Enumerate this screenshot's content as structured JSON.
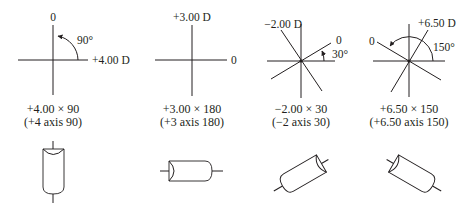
{
  "figure": {
    "panels": [
      {
        "id": "panel-1",
        "axis_labels": {
          "top": "0",
          "right": "+4.00 D"
        },
        "angle_label": "90°",
        "caption_line1": "+4.00 × 90",
        "caption_line2": "(+4 axis 90)"
      },
      {
        "id": "panel-2",
        "axis_labels": {
          "top": "+3.00 D",
          "right": "0"
        },
        "caption_line1": "+3.00 × 180",
        "caption_line2": "(+3 axis 180)"
      },
      {
        "id": "panel-3",
        "axis_labels": {
          "power": "−2.00 D",
          "axis": "0"
        },
        "angle_label": "30°",
        "caption_line1": "−2.00 × 30",
        "caption_line2": "(−2 axis 30)"
      },
      {
        "id": "panel-4",
        "axis_labels": {
          "power": "+6.50 D",
          "axis": "0"
        },
        "angle_label": "150°",
        "caption_line1": "+6.50 × 150",
        "caption_line2": "(+6.50 axis 150)"
      }
    ],
    "colors": {
      "ink": "#231f20",
      "background": "#ffffff"
    }
  }
}
